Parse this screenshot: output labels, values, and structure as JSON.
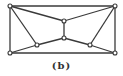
{
  "caption": "(b)",
  "graph": {
    "nodes": [
      {
        "id": "tl",
        "x": 10,
        "y": 6
      },
      {
        "id": "tr",
        "x": 115,
        "y": 6
      },
      {
        "id": "bl",
        "x": 10,
        "y": 53
      },
      {
        "id": "br",
        "x": 115,
        "y": 53
      },
      {
        "id": "ct",
        "x": 64,
        "y": 21
      },
      {
        "id": "cb",
        "x": 64,
        "y": 38
      },
      {
        "id": "il",
        "x": 37,
        "y": 45
      },
      {
        "id": "ir",
        "x": 90,
        "y": 45
      }
    ],
    "edges": [
      [
        "tl",
        "tr"
      ],
      [
        "tl",
        "bl"
      ],
      [
        "tr",
        "br"
      ],
      [
        "bl",
        "br"
      ],
      [
        "tl",
        "ct"
      ],
      [
        "tr",
        "ct"
      ],
      [
        "ct",
        "cb"
      ],
      [
        "tl",
        "il"
      ],
      [
        "tr",
        "ir"
      ],
      [
        "bl",
        "il"
      ],
      [
        "il",
        "cb"
      ],
      [
        "cb",
        "ir"
      ],
      [
        "ir",
        "br"
      ]
    ]
  }
}
